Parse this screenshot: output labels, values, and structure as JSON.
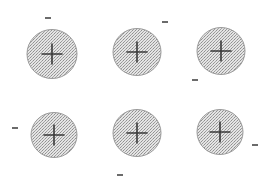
{
  "diagram": {
    "colors": {
      "background": "#ffffff",
      "circle_fill": "#d9d9d9",
      "circle_stroke": "#9a9a9a",
      "stipple_dark": "#8f8f8f",
      "stipple_light": "#ececec",
      "plus": "#3a3a3a",
      "minus": "#3a3a3a"
    },
    "charges": [
      {
        "id": 1,
        "sign": "+",
        "cx": 52,
        "cy": 54,
        "r": 25,
        "minus": {
          "x": 48,
          "y": 18
        }
      },
      {
        "id": 2,
        "sign": "+",
        "cx": 137,
        "cy": 52,
        "r": 24,
        "minus": {
          "x": 165,
          "y": 22
        }
      },
      {
        "id": 3,
        "sign": "+",
        "cx": 221,
        "cy": 51,
        "r": 24,
        "minus": {
          "x": 195,
          "y": 80
        }
      },
      {
        "id": 4,
        "sign": "+",
        "cx": 54,
        "cy": 135,
        "r": 23,
        "minus": {
          "x": 15,
          "y": 128
        }
      },
      {
        "id": 5,
        "sign": "+",
        "cx": 137,
        "cy": 133,
        "r": 24,
        "minus": {
          "x": 120,
          "y": 175
        }
      },
      {
        "id": 6,
        "sign": "+",
        "cx": 220,
        "cy": 132,
        "r": 23,
        "minus": {
          "x": 255,
          "y": 145
        }
      }
    ]
  }
}
